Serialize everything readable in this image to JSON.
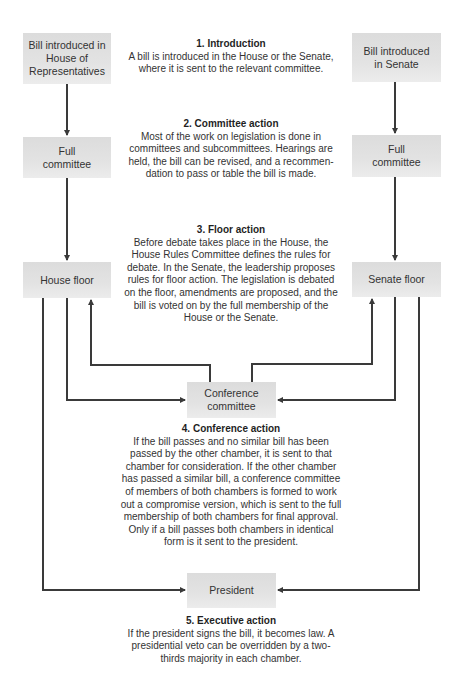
{
  "diagram": {
    "nodes": {
      "bill_house": "Bill introduced in House of Representatives",
      "bill_senate": "Bill introduced in Senate",
      "house_committee": "Full committee",
      "senate_committee": "Full committee",
      "house_floor": "House floor",
      "senate_floor": "Senate floor",
      "conference": "Conference committee",
      "president": "President"
    },
    "steps": [
      {
        "title": "1.  Introduction",
        "text": "A bill is introduced in the House or the Senate, where it is sent to the relevant committee."
      },
      {
        "title": "2.  Committee action",
        "text": "Most of the work on legislation is done in committees and subcommittees. Hearings are held, the bill can be revised, and a recommen-dation to pass or table the bill is made."
      },
      {
        "title": "3.  Floor action",
        "text": "Before debate takes place in the House, the House Rules Committee defines the rules for debate. In the Senate, the leadership proposes rules for floor action. The legislation is debated on the floor, amendments are proposed, and the bill is voted on by the full membership of the House or the Senate."
      },
      {
        "title": "4.  Conference action",
        "text": "If the bill passes and no similar bill has been passed by the other chamber, it is sent to that chamber for consideration. If the other chamber has passed a similar bill, a conference committee of members of both chambers is formed to work out a compromise version, which is sent to the full membership of both chambers for final approval. Only if a bill passes both chambers in identical form is it sent to the president."
      },
      {
        "title": "5.  Executive action",
        "text": "If the president signs the bill, it becomes law. A presidential veto can be overridden by a two-thirds majority in each chamber."
      }
    ],
    "edges": [
      {
        "from": "bill_house",
        "to": "house_committee"
      },
      {
        "from": "house_committee",
        "to": "house_floor"
      },
      {
        "from": "bill_senate",
        "to": "senate_committee"
      },
      {
        "from": "senate_committee",
        "to": "senate_floor"
      },
      {
        "from": "house_floor",
        "to": "conference"
      },
      {
        "from": "senate_floor",
        "to": "conference"
      },
      {
        "from": "conference",
        "to": "house_floor"
      },
      {
        "from": "conference",
        "to": "senate_floor"
      },
      {
        "from": "house_floor",
        "to": "president"
      },
      {
        "from": "senate_floor",
        "to": "president"
      }
    ],
    "colors": {
      "box_fill": "#e0e0e0",
      "line": "#3a3a3a",
      "text": "#333333"
    }
  }
}
